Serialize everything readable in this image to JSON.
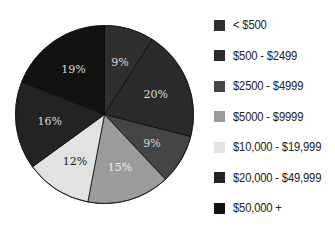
{
  "chart_data": {
    "type": "pie",
    "title": "",
    "start_angle": "12 o'clock",
    "direction": "clockwise",
    "categories": [
      "< $500",
      "$500 - $2499",
      "$2500 - $4999",
      "$5000 - $9999",
      "$10,000 - $19,999",
      "$20,000 - $49,999",
      "$50,000 +"
    ],
    "values": [
      9,
      20,
      9,
      15,
      12,
      16,
      19
    ],
    "labels": [
      "9%",
      "20%",
      "9%",
      "15%",
      "12%",
      "16%",
      "19%"
    ],
    "colors": [
      "#2f2f2f",
      "#2b2b2b",
      "#454545",
      "#9b9b9b",
      "#e2e2e2",
      "#232323",
      "#121212"
    ],
    "label_colors": [
      "#d8d8d8",
      "#d8d8d8",
      "#d8d8d8",
      "#ececec",
      "#222222",
      "#d8d8d8",
      "#d8d8d8"
    ],
    "legend_position": "right",
    "grid": false
  },
  "legend": {
    "items": [
      {
        "label": "< $500",
        "color": "#2f2f2f"
      },
      {
        "label": "$500 - $2499",
        "color": "#2b2b2b"
      },
      {
        "label": "$2500 - $4999",
        "color": "#454545"
      },
      {
        "label": "$5000 - $9999",
        "color": "#9b9b9b"
      },
      {
        "label": "$10,000 - $19,999",
        "color": "#e2e2e2"
      },
      {
        "label": "$20,000 - $49,999",
        "color": "#232323"
      },
      {
        "label": "$50,000 +",
        "color": "#121212"
      }
    ]
  }
}
